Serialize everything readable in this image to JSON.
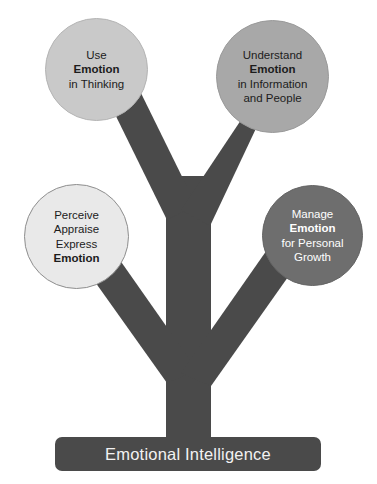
{
  "diagram": {
    "title": "Emotional Intelligence",
    "canvas": {
      "width": 377,
      "height": 484,
      "background": "#ffffff"
    },
    "trunk_color": "#4a4a4a",
    "banner": {
      "label": "Emotional Intelligence",
      "background": "#4a4a4a",
      "text_color": "#f2f2f2"
    },
    "nodes": [
      {
        "id": "use-emotion",
        "position": "top-left",
        "fill": "#c9c9c9",
        "text_color": "#1c1c1c",
        "lines": [
          {
            "text": "Use",
            "bold": false
          },
          {
            "text": "Emotion",
            "bold": true
          },
          {
            "text": "in Thinking",
            "bold": false
          }
        ]
      },
      {
        "id": "understand-emotion",
        "position": "top-right",
        "fill": "#a8a8a8",
        "text_color": "#1c1c1c",
        "lines": [
          {
            "text": "Understand",
            "bold": false
          },
          {
            "text": "Emotion",
            "bold": true
          },
          {
            "text": "in Information",
            "bold": false
          },
          {
            "text": "and People",
            "bold": false
          }
        ]
      },
      {
        "id": "perceive-emotion",
        "position": "bottom-left",
        "fill": "#e9e9e9",
        "text_color": "#1c1c1c",
        "lines": [
          {
            "text": "Perceive",
            "bold": false
          },
          {
            "text": "Appraise",
            "bold": false
          },
          {
            "text": "Express",
            "bold": false
          },
          {
            "text": "Emotion",
            "bold": true
          }
        ]
      },
      {
        "id": "manage-emotion",
        "position": "bottom-right",
        "fill": "#6e6e6e",
        "text_color": "#ffffff",
        "lines": [
          {
            "text": "Manage",
            "bold": false
          },
          {
            "text": "Emotion",
            "bold": true
          },
          {
            "text": "for Personal",
            "bold": false
          },
          {
            "text": "Growth",
            "bold": false
          }
        ]
      }
    ]
  }
}
